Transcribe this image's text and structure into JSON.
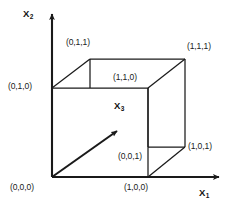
{
  "figure": {
    "stroke_color": "#1a1a1a",
    "background_color": "#ffffff"
  },
  "axes": [
    {
      "name": "x1",
      "label": "X",
      "subscript": "1",
      "direction": "right",
      "origin": [
        52,
        177
      ],
      "tip": [
        224,
        177
      ]
    },
    {
      "name": "x2",
      "label": "X",
      "subscript": "2",
      "direction": "up",
      "origin": [
        52,
        177
      ],
      "tip": [
        52,
        10
      ]
    },
    {
      "name": "x3",
      "label": "X",
      "subscript": "3",
      "direction": "up-right-diagonal",
      "origin": [
        52,
        177
      ],
      "tip": [
        121,
        127
      ]
    }
  ],
  "axis_labels": {
    "x1": "X",
    "x1_sub": "1",
    "x2": "X",
    "x2_sub": "2",
    "x3": "X",
    "x3_sub": "3"
  },
  "vertices": [
    {
      "name": "origin",
      "coord": "(0,0,0)",
      "point": [
        52,
        177
      ],
      "label_pos": [
        10,
        183
      ]
    },
    {
      "name": "x1-unit",
      "coord": "(1,0,0)",
      "point": [
        148,
        177
      ],
      "label_pos": [
        124,
        183
      ]
    },
    {
      "name": "x2-unit",
      "coord": "(0,1,0)",
      "point": [
        52,
        88
      ],
      "label_pos": [
        8,
        81
      ]
    },
    {
      "name": "x3-unit",
      "coord": "(0,0,1)",
      "point": [
        148,
        147
      ],
      "label_pos": [
        118,
        152
      ]
    },
    {
      "name": "x1x2",
      "coord": "(1,1,0)",
      "point": [
        148,
        88
      ],
      "label_pos": [
        113,
        78
      ]
    },
    {
      "name": "x2x3",
      "coord": "(0,1,1)",
      "point": [
        90,
        59
      ],
      "label_pos": [
        66,
        38
      ]
    },
    {
      "name": "x1x3",
      "coord": "(1,0,1)",
      "point": [
        185,
        147
      ],
      "label_pos": [
        188,
        142
      ]
    },
    {
      "name": "x1x2x3",
      "coord": "(1,1,1)",
      "point": [
        185,
        59
      ],
      "label_pos": [
        187,
        41
      ]
    }
  ],
  "edges": [
    {
      "from": "(0,0,0)",
      "to": "(1,0,0)"
    },
    {
      "from": "(0,0,0)",
      "to": "(0,1,0)"
    },
    {
      "from": "(0,1,0)",
      "to": "(1,1,0)"
    },
    {
      "from": "(1,0,0)",
      "to": "(1,1,0)"
    },
    {
      "from": "(0,1,0)",
      "to": "(0,1,1)"
    },
    {
      "from": "(0,1,1)",
      "to": "(1,1,1)"
    },
    {
      "from": "(1,1,0)",
      "to": "(1,1,1)"
    },
    {
      "from": "(0,1,1)",
      "to": "(0,0,1)"
    },
    {
      "from": "(0,0,1)",
      "to": "(1,0,1)"
    },
    {
      "from": "(1,0,1)",
      "to": "(1,1,1)"
    },
    {
      "from": "(1,0,0)",
      "to": "(1,0,1)"
    },
    {
      "from": "(0,0,1)",
      "to": "(1,1,0)"
    }
  ]
}
